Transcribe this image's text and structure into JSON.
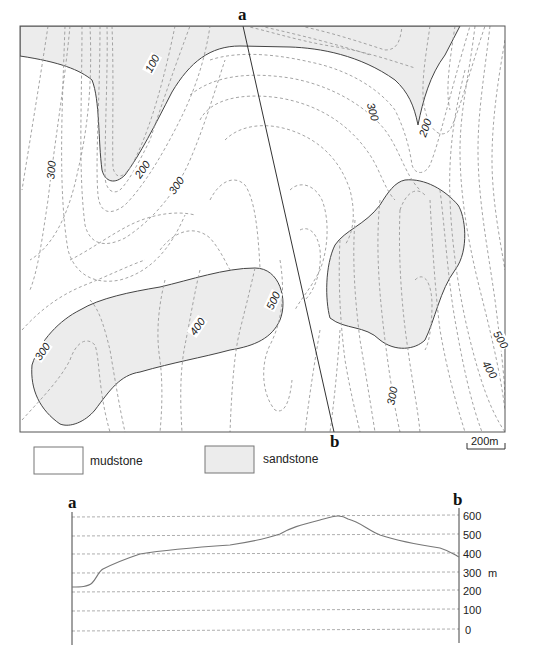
{
  "map": {
    "section_start_label": "a",
    "section_end_label": "b",
    "contour_labels": [
      {
        "text": "100",
        "x": 153,
        "y": 64,
        "rotate": -62
      },
      {
        "text": "300",
        "x": 52,
        "y": 170,
        "rotate": -85
      },
      {
        "text": "200",
        "x": 143,
        "y": 170,
        "rotate": -55
      },
      {
        "text": "300",
        "x": 177,
        "y": 186,
        "rotate": -55
      },
      {
        "text": "300",
        "x": 372,
        "y": 112,
        "rotate": 75
      },
      {
        "text": "200",
        "x": 426,
        "y": 128,
        "rotate": -70
      },
      {
        "text": "300",
        "x": 43,
        "y": 352,
        "rotate": -55
      },
      {
        "text": "400",
        "x": 198,
        "y": 327,
        "rotate": -55
      },
      {
        "text": "500",
        "x": 274,
        "y": 301,
        "rotate": -65
      },
      {
        "text": "500",
        "x": 500,
        "y": 340,
        "rotate": 60
      },
      {
        "text": "400",
        "x": 489,
        "y": 370,
        "rotate": 60
      },
      {
        "text": "300",
        "x": 393,
        "y": 396,
        "rotate": -80
      }
    ],
    "scale_bar_label": "200m"
  },
  "legend": {
    "items": [
      {
        "label": "mudstone",
        "color": "#ffffff"
      },
      {
        "label": "sandstone",
        "color": "#ececec"
      }
    ]
  },
  "section": {
    "start_label": "a",
    "end_label": "b",
    "unit": "m",
    "y_ticks": [
      "600",
      "500",
      "400",
      "300",
      "200",
      "100",
      "0"
    ]
  },
  "chart_data": {
    "type": "line",
    "xlabel": "Distance along section a to b",
    "ylabel": "m",
    "ylim": [
      0,
      600
    ],
    "y_ticks": [
      0,
      100,
      200,
      300,
      400,
      500,
      600
    ],
    "grid": true,
    "x": [
      0,
      0.05,
      0.08,
      0.1,
      0.18,
      0.3,
      0.45,
      0.55,
      0.65,
      0.75,
      0.8,
      0.85,
      0.9,
      1.0
    ],
    "series": [
      {
        "name": "ground surface",
        "values": [
          230,
          240,
          270,
          310,
          400,
          430,
          460,
          500,
          540,
          575,
          560,
          500,
          470,
          390
        ]
      }
    ]
  },
  "colors": {
    "sandstone_fill": "#ececec",
    "mudstone_fill": "#ffffff",
    "contour_stroke": "#9a9a9a",
    "boundary_stroke": "#444444"
  }
}
